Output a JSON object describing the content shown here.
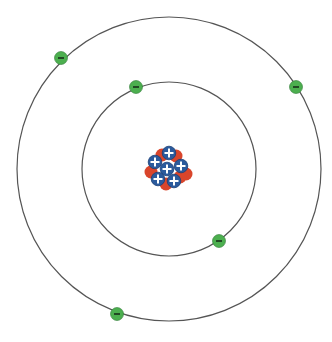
{
  "diagram": {
    "type": "bohr-atom-model",
    "nucleus": {
      "center": [
        168,
        168
      ],
      "proton_count": 6,
      "proton_symbol": "+",
      "proton_color": "#2b5a9c",
      "proton_border": "#1b3e75",
      "neutron_color": "#d9452b",
      "protons": [
        [
          169,
          153
        ],
        [
          155,
          162
        ],
        [
          167,
          169
        ],
        [
          181,
          166
        ],
        [
          158,
          179
        ],
        [
          174,
          181
        ]
      ],
      "neutrons": [
        [
          162,
          155
        ],
        [
          176,
          156
        ],
        [
          186,
          174
        ],
        [
          151,
          172
        ],
        [
          166,
          184
        ],
        [
          180,
          177
        ]
      ]
    },
    "orbits": [
      {
        "name": "inner",
        "cx": 169,
        "cy": 169,
        "r": 87,
        "electron_count": 2
      },
      {
        "name": "outer",
        "cx": 169,
        "cy": 169,
        "r": 152,
        "electron_count": 3
      }
    ],
    "electron_symbol": "-",
    "electron_color": "#4caf4f",
    "electron_dark": "#2f7a35",
    "orbit_color": "#555555",
    "electrons": [
      {
        "orbit": "outer",
        "x": 61,
        "y": 58
      },
      {
        "orbit": "inner",
        "x": 136,
        "y": 87
      },
      {
        "orbit": "outer",
        "x": 296,
        "y": 87
      },
      {
        "orbit": "inner",
        "x": 219,
        "y": 241
      },
      {
        "orbit": "outer",
        "x": 117,
        "y": 314
      }
    ]
  }
}
